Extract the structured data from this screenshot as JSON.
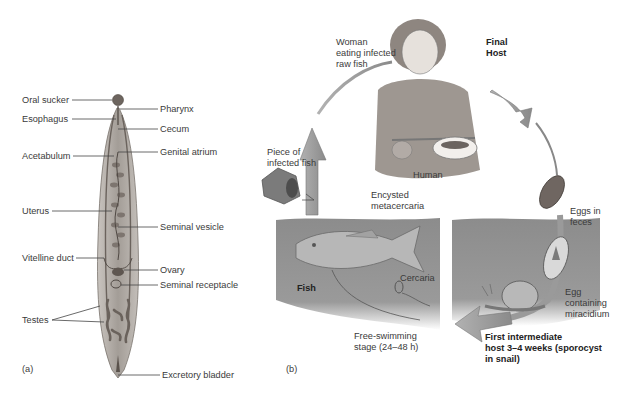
{
  "panel_a": {
    "tag": "(a)",
    "labels_left": {
      "oral_sucker": "Oral sucker",
      "esophagus": "Esophagus",
      "acetabulum": "Acetabulum",
      "uterus": "Uterus",
      "vitelline_duct": "Vitelline duct",
      "testes": "Testes"
    },
    "labels_right": {
      "pharynx": "Pharynx",
      "cecum": "Cecum",
      "genital_atrium": "Genital atrium",
      "seminal_vesicle": "Seminal vesicle",
      "ovary": "Ovary",
      "seminal_receptacle": "Seminal receptacle",
      "excretory_bladder": "Excretory bladder"
    }
  },
  "panel_b": {
    "tag": "(b)",
    "woman_caption": "Woman\neating infected\nraw fish",
    "final_host": "Final\nHost",
    "human": "Human",
    "piece_of_fish": "Piece of\ninfected fish",
    "encysted": "Encysted\nmetacercaria",
    "fish": "Fish",
    "cercaria": "Cercaria",
    "free_swimming": "Free-swimming\nstage (24–48 h)",
    "eggs_in_feces": "Eggs in\nfeces",
    "egg_miracidium": "Egg\ncontaining\nmiracidium",
    "first_intermediate": "First intermediate\nhost 3–4 weeks (sporocyst\nin snail)"
  },
  "colors": {
    "fluke_body": "#a8a29c",
    "fluke_organs": "#6f6761",
    "water": "#8f8f8f",
    "arrow": "#9b9b9b",
    "label_line": "#444444"
  }
}
